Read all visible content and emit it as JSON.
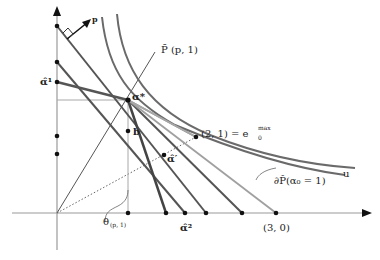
{
  "figure": {
    "labels": {
      "p_vector": "p",
      "p_bar_ray": "P̄ (p, 1)",
      "alpha_hat_1": "α̂¹",
      "alpha_star": "α*",
      "b_point": "b",
      "alpha_hat_prime": "α̂′",
      "point_2_1": "(2, 1) = e",
      "point_2_1_sup": "max",
      "point_2_1_sub": "0",
      "u_curve": "u",
      "boundary": "∂P̂(α₀ = 1)",
      "theta": "θ",
      "theta_sub": "(p, 1)",
      "alpha_hat_2": "α̂²",
      "point_3_0": "(3, 0)"
    },
    "colors": {
      "axis": "#8a8a8a",
      "dark_line": "#4a4a4a",
      "medium_line": "#6a6a6a",
      "light_line": "#a0a0a0",
      "point": "#111111",
      "text": "#222222"
    }
  }
}
